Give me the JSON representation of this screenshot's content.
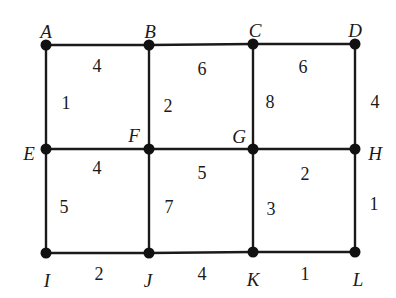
{
  "diagram": {
    "type": "weighted-grid-graph",
    "nodes": [
      {
        "id": "A",
        "x": 46,
        "y": 45,
        "lx": 46,
        "ly": 34
      },
      {
        "id": "B",
        "x": 149,
        "y": 45,
        "lx": 150,
        "ly": 34
      },
      {
        "id": "C",
        "x": 253,
        "y": 44,
        "lx": 255,
        "ly": 33
      },
      {
        "id": "D",
        "x": 355,
        "y": 44,
        "lx": 355,
        "ly": 33
      },
      {
        "id": "E",
        "x": 46,
        "y": 149,
        "lx": 29,
        "ly": 156
      },
      {
        "id": "F",
        "x": 149,
        "y": 149,
        "lx": 134,
        "ly": 138
      },
      {
        "id": "G",
        "x": 253,
        "y": 149,
        "lx": 239,
        "ly": 139
      },
      {
        "id": "H",
        "x": 355,
        "y": 149,
        "lx": 375,
        "ly": 156
      },
      {
        "id": "I",
        "x": 46,
        "y": 253,
        "lx": 47,
        "ly": 283
      },
      {
        "id": "J",
        "x": 149,
        "y": 253,
        "lx": 148,
        "ly": 283
      },
      {
        "id": "K",
        "x": 253,
        "y": 252,
        "lx": 253,
        "ly": 282
      },
      {
        "id": "L",
        "x": 355,
        "y": 252,
        "lx": 358,
        "ly": 282
      }
    ],
    "edges": [
      {
        "from": "A",
        "to": "B",
        "weight": "4",
        "wx": 97,
        "wy": 68
      },
      {
        "from": "B",
        "to": "C",
        "weight": "6",
        "wx": 202,
        "wy": 71
      },
      {
        "from": "C",
        "to": "D",
        "weight": "6",
        "wx": 303,
        "wy": 69
      },
      {
        "from": "A",
        "to": "E",
        "weight": "1",
        "wx": 66,
        "wy": 105
      },
      {
        "from": "B",
        "to": "F",
        "weight": "2",
        "wx": 168,
        "wy": 108
      },
      {
        "from": "C",
        "to": "G",
        "weight": "8",
        "wx": 270,
        "wy": 104
      },
      {
        "from": "D",
        "to": "H",
        "weight": "4",
        "wx": 375,
        "wy": 104
      },
      {
        "from": "E",
        "to": "F",
        "weight": "4",
        "wx": 97,
        "wy": 170
      },
      {
        "from": "F",
        "to": "G",
        "weight": "5",
        "wx": 202,
        "wy": 175
      },
      {
        "from": "G",
        "to": "H",
        "weight": "2",
        "wx": 305,
        "wy": 176
      },
      {
        "from": "E",
        "to": "I",
        "weight": "5",
        "wx": 64,
        "wy": 209
      },
      {
        "from": "F",
        "to": "J",
        "weight": "7",
        "wx": 169,
        "wy": 209
      },
      {
        "from": "G",
        "to": "K",
        "weight": "3",
        "wx": 271,
        "wy": 211
      },
      {
        "from": "H",
        "to": "L",
        "weight": "1",
        "wx": 374,
        "wy": 206
      },
      {
        "from": "I",
        "to": "J",
        "weight": "2",
        "wx": 99,
        "wy": 276
      },
      {
        "from": "J",
        "to": "K",
        "weight": "4",
        "wx": 202,
        "wy": 276
      },
      {
        "from": "K",
        "to": "L",
        "weight": "1",
        "wx": 305,
        "wy": 276
      }
    ],
    "colors": {
      "line": "#1a1a1a",
      "node": "#111111",
      "background": "#ffffff"
    }
  }
}
